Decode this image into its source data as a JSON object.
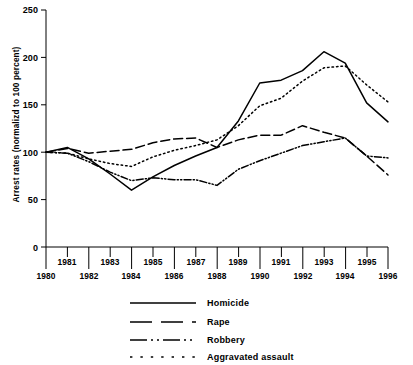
{
  "chart_data": {
    "type": "line",
    "title": "",
    "xlabel": "",
    "ylabel": "Arrest rates (normalizd to 100 percent)",
    "xlim": [
      1980,
      1996
    ],
    "ylim": [
      0,
      250
    ],
    "grid": false,
    "legend_position": "bottom",
    "x": [
      1980,
      1981,
      1982,
      1983,
      1984,
      1985,
      1986,
      1987,
      1988,
      1989,
      1990,
      1991,
      1992,
      1993,
      1994,
      1995,
      1996
    ],
    "xtick_labels_upper": [
      "1981",
      "1983",
      "1985",
      "1987",
      "1989",
      "1991",
      "1993",
      "1995"
    ],
    "xtick_labels_lower": [
      "1980",
      "1982",
      "1984",
      "1986",
      "1988",
      "1990",
      "1992",
      "1994",
      "1996"
    ],
    "ytick_labels": [
      "0",
      "50",
      "100",
      "150",
      "200",
      "250"
    ],
    "yticks": [
      0,
      50,
      100,
      150,
      200,
      250
    ],
    "series": [
      {
        "name": "Homicide",
        "style": "solid",
        "values": [
          100,
          105,
          93,
          77,
          60,
          74,
          86,
          96,
          105,
          133,
          173,
          176,
          186,
          206,
          194,
          152,
          132
        ]
      },
      {
        "name": "Rape",
        "style": "dashed",
        "values": [
          100,
          104,
          99,
          101,
          103,
          110,
          114,
          115,
          105,
          113,
          118,
          118,
          128,
          121,
          115,
          96,
          76
        ]
      },
      {
        "name": "Robbery",
        "style": "dash-dot-dot",
        "values": [
          100,
          99,
          90,
          79,
          70,
          73,
          71,
          71,
          65,
          82,
          91,
          99,
          107,
          111,
          115,
          96,
          94
        ]
      },
      {
        "name": "Aggravated assault",
        "style": "dotted",
        "values": [
          100,
          99,
          93,
          88,
          85,
          95,
          102,
          107,
          113,
          128,
          149,
          157,
          175,
          189,
          191,
          171,
          153
        ]
      }
    ]
  },
  "legend": {
    "items": [
      {
        "label": "Homicide",
        "style": "solid"
      },
      {
        "label": "Rape",
        "style": "dashed"
      },
      {
        "label": "Robbery",
        "style": "dash-dot-dot"
      },
      {
        "label": "Aggravated assault",
        "style": "dotted"
      }
    ]
  },
  "colors": {
    "line": "#000000",
    "axis": "#000000",
    "background": "#ffffff"
  }
}
